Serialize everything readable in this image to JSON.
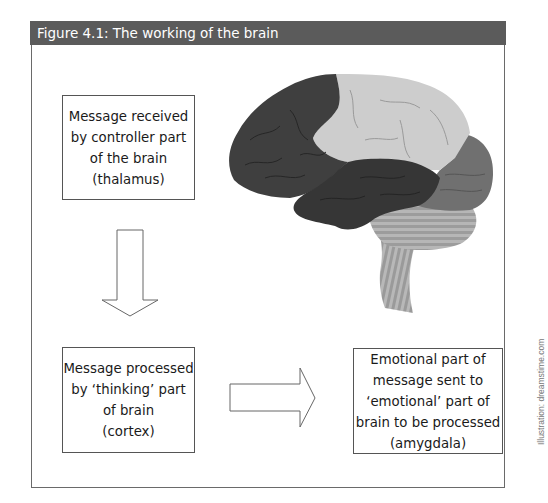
{
  "figure": {
    "title": "Figure 4.1: The working of the brain",
    "credit": "Illustration: dreamstime.com"
  },
  "boxes": [
    {
      "id": "thalamus",
      "lines": [
        "Message received",
        "by controller part",
        "of the brain",
        "(thalamus)"
      ]
    },
    {
      "id": "cortex",
      "lines": [
        "Message processed",
        "by ‘thinking’ part",
        "of brain",
        "(cortex)"
      ]
    },
    {
      "id": "amygdala",
      "lines": [
        "Emotional part of",
        "message sent to",
        "‘emotional’ part of",
        "brain to be processed",
        "(amygdala)"
      ]
    }
  ],
  "arrows": [
    {
      "from": "thalamus",
      "to": "cortex",
      "direction": "down"
    },
    {
      "from": "cortex",
      "to": "amygdala",
      "direction": "right"
    }
  ],
  "brain_illustration": {
    "regions": [
      {
        "name": "frontal-lobe",
        "color": "#3f3f3f"
      },
      {
        "name": "parietal-lobe",
        "color": "#cdcdcd"
      },
      {
        "name": "temporal-lobe",
        "color": "#363636"
      },
      {
        "name": "occipital-lobe",
        "color": "#707070"
      },
      {
        "name": "cerebellum",
        "color": "#9a9a9a"
      },
      {
        "name": "brain-stem",
        "color": "#a0a0a0"
      }
    ]
  },
  "colors": {
    "header_bg": "#5b5b5b",
    "header_text": "#ffffff",
    "border": "#555555"
  }
}
